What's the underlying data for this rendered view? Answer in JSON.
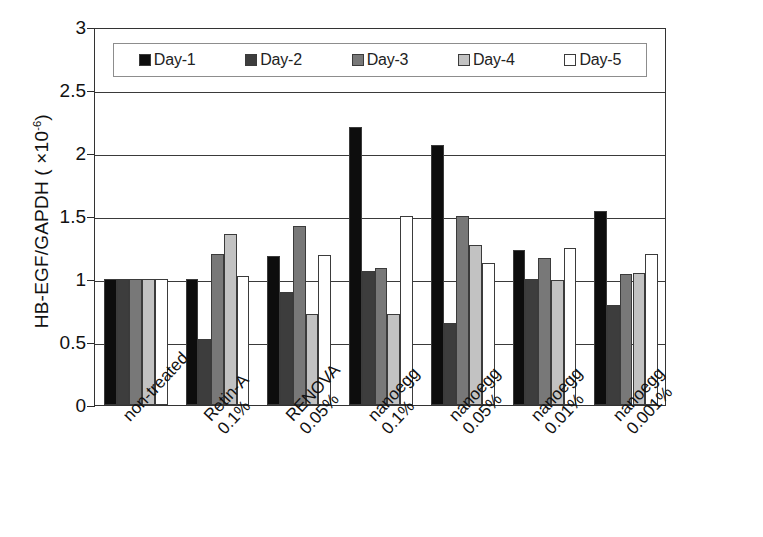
{
  "chart_data": {
    "type": "bar",
    "title": "",
    "xlabel": "",
    "ylabel": "HB-EGF/GAPDH ( ×10-6)",
    "ylabel_base": "HB-EGF/GAPDH  ( ×10",
    "ylabel_exponent": "-6",
    "ylabel_tail": ")",
    "ylim": [
      0,
      3
    ],
    "ytick_values": [
      0,
      0.5,
      1,
      1.5,
      2,
      2.5,
      3
    ],
    "ytick_labels": [
      "0",
      "0.5",
      "1",
      "1.5",
      "2",
      "2.5",
      "3"
    ],
    "grid": true,
    "legend_position": "top-inside",
    "categories": [
      "non-treated",
      "Retin-A 0.1%",
      "RENOVA 0.05%",
      "nanoegg 0.1%",
      "nanoegg 0.05%",
      "nanoegg 0.01%",
      "nanoegg 0.001%"
    ],
    "category_lines": [
      {
        "line1": "non-treated",
        "line2": ""
      },
      {
        "line1": "Retin-A",
        "line2": "0.1%"
      },
      {
        "line1": "RENOVA",
        "line2": "0.05%"
      },
      {
        "line1": "nanoegg",
        "line2": "0.1%"
      },
      {
        "line1": "nanoegg",
        "line2": "0.05%"
      },
      {
        "line1": "nanoegg",
        "line2": "0.01%"
      },
      {
        "line1": "nanoegg",
        "line2": "0.001%"
      }
    ],
    "series": [
      {
        "name": "Day-1",
        "color": "#0d0d0d",
        "values": [
          1.0,
          1.0,
          1.18,
          2.21,
          2.06,
          1.23,
          1.54
        ]
      },
      {
        "name": "Day-2",
        "color": "#3d3d3d",
        "values": [
          1.0,
          0.52,
          0.9,
          1.06,
          0.65,
          1.0,
          0.79
        ]
      },
      {
        "name": "Day-3",
        "color": "#787878",
        "values": [
          1.0,
          1.2,
          1.42,
          1.09,
          1.5,
          1.17,
          1.04
        ]
      },
      {
        "name": "Day-4",
        "color": "#c2c2c2",
        "values": [
          1.0,
          1.36,
          0.72,
          0.72,
          1.27,
          0.99,
          1.05
        ]
      },
      {
        "name": "Day-5",
        "color": "#ffffff",
        "values": [
          1.0,
          1.02,
          1.19,
          1.5,
          1.13,
          1.25,
          1.2
        ]
      }
    ]
  },
  "legend": {
    "entries": [
      {
        "label": "Day-1",
        "color": "#0d0d0d"
      },
      {
        "label": "Day-2",
        "color": "#3d3d3d"
      },
      {
        "label": "Day-3",
        "color": "#787878"
      },
      {
        "label": "Day-4",
        "color": "#c2c2c2"
      },
      {
        "label": "Day-5",
        "color": "#ffffff"
      }
    ]
  }
}
